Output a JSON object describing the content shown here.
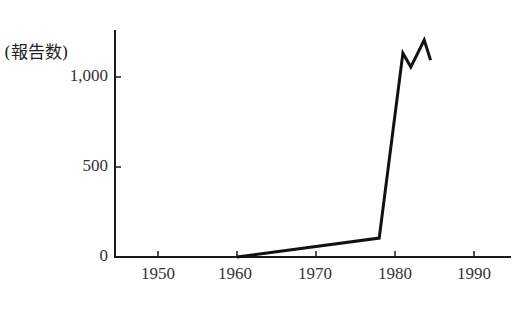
{
  "chart_data": {
    "type": "line",
    "title": "",
    "xlabel": "",
    "ylabel": "(報告数)",
    "x": [
      1960,
      1978,
      1981,
      1982,
      1983.7,
      1984.5
    ],
    "series": [
      {
        "name": "報告数",
        "values": [
          0,
          105,
          1133,
          1055,
          1205,
          1094
        ]
      }
    ],
    "xlim": [
      1945,
      1994
    ],
    "ylim": [
      0,
      1270
    ],
    "x_ticks": [
      1950,
      1960,
      1970,
      1980,
      1990
    ],
    "x_tick_labels": [
      "1950",
      "1960",
      "1970",
      "1980",
      "1990"
    ],
    "y_ticks": [
      0,
      500,
      1000
    ],
    "y_tick_labels": [
      "0",
      "500",
      "1,000"
    ],
    "grid": false,
    "legend": "none",
    "line_color": "#111111"
  }
}
